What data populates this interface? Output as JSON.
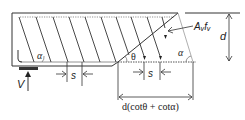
{
  "diagram": {
    "type": "shear-truss-beam",
    "labels": {
      "alpha_left": "α",
      "alpha_right": "α",
      "theta": "θ",
      "stirrup_force": "Aᵥfᵥ",
      "depth": "d",
      "spacing_left": "s",
      "spacing_right": "s",
      "reaction": "V",
      "crack_projection": "d(cotθ + cotα)"
    },
    "colors": {
      "stroke": "#333333",
      "light_stroke": "#8a8a8a",
      "background": "#ffffff"
    }
  }
}
